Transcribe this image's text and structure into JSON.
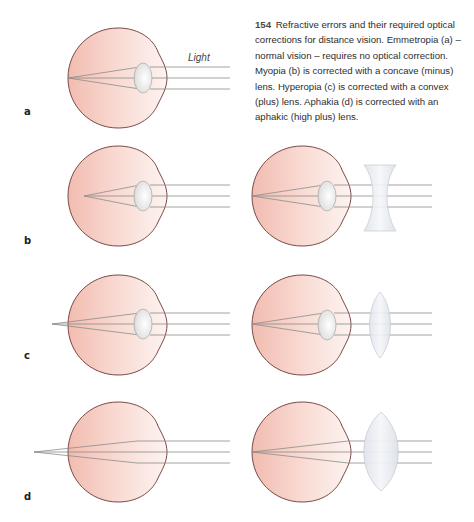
{
  "caption": {
    "figure_number": "154",
    "text": "Refractive errors and their required optical corrections for distance vision. Emmetropia (a) – normal vision –  requires no optical correction. Myopia (b) is corrected with a concave (minus) lens. Hyperopia (c) is corrected with a convex (plus) lens. Aphakia (d) is corrected with an aphakic (high plus) lens."
  },
  "annotations": {
    "light": "Light"
  },
  "panels": [
    {
      "label": "a",
      "condition": "Emmetropia",
      "correction": "none"
    },
    {
      "label": "b",
      "condition": "Myopia",
      "correction": "concave (minus) lens"
    },
    {
      "label": "c",
      "condition": "Hyperopia",
      "correction": "convex (plus) lens"
    },
    {
      "label": "d",
      "condition": "Aphakia",
      "correction": "aphakic (high plus) lens"
    }
  ],
  "colors": {
    "eye_fill_dark": "#f0b9ad",
    "eye_fill_light": "#fdf1ee",
    "eye_outline": "#7a4a48",
    "ray": "#8c8c8c",
    "lens_fill": "#e4e8ee",
    "lens_outline": "#b9bec6"
  }
}
